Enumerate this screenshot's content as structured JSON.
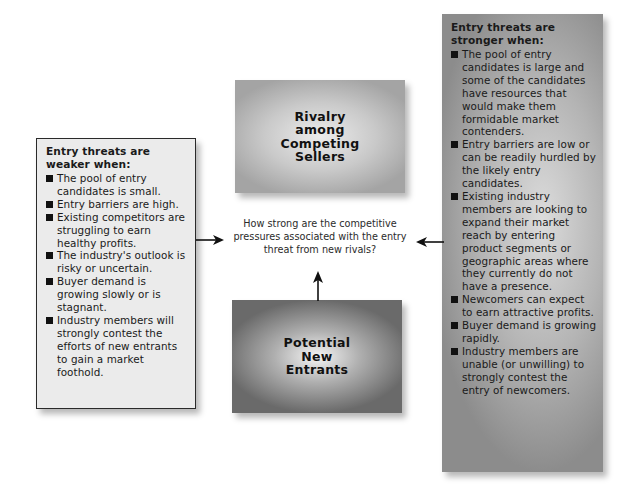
{
  "diagram": {
    "central_question": "How strong are the competitive pressures associated with the entry threat from new rivals?",
    "rivalry_box": {
      "label_lines": [
        "Rivalry",
        "among",
        "Competing",
        "Sellers"
      ]
    },
    "entrants_box": {
      "label_lines": [
        "Potential",
        "New",
        "Entrants"
      ]
    },
    "weaker_box": {
      "heading_lines": [
        "Entry threats are",
        "weaker when:"
      ],
      "items": [
        "The pool of entry candidates is small.",
        "Entry barriers are high.",
        "Existing competitors are struggling to earn healthy profits.",
        "The industry's outlook is risky or uncertain.",
        "Buyer demand is growing slowly or is stagnant.",
        "Industry members will strongly contest the efforts of new entrants to gain a market foothold."
      ]
    },
    "stronger_box": {
      "heading_lines": [
        "Entry threats are",
        "stronger when:"
      ],
      "items": [
        "The pool of entry candidates is large and some of the candidates have resources that would make them formidable market contenders.",
        "Entry barriers are low or can be readily hurdled by the likely entry candidates.",
        "Existing industry members are looking to expand their market reach by entering product segments or geographic areas where they currently do not have a presence.",
        "Newcomers can expect to earn attractive profits.",
        "Buyer demand is growing rapidly.",
        "Industry members are unable (or unwilling) to strongly contest the entry of newcomers."
      ]
    },
    "colors": {
      "weaker_box_bg": "#ebebeb",
      "stronger_box_bg": "#a8a8a8",
      "arrow": "#111111"
    }
  }
}
